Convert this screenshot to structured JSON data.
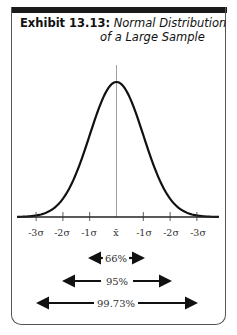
{
  "exhibit": {
    "label": "Exhibit 13.13:",
    "title_line1": "Normal Distribution",
    "title_line2": "of a Large Sample"
  },
  "chart_data": {
    "type": "line",
    "title": "Normal Distribution of a Large Sample",
    "xlabel": "",
    "ylabel": "",
    "x_tick_labels": [
      "-3σ",
      "-2σ",
      "-1σ",
      "x̄",
      "-1σ",
      "-2σ",
      "-3σ"
    ],
    "curve": "bell-shaped normal curve centered at mean x̄",
    "center_line": true,
    "grid": false,
    "intervals": [
      {
        "label": "66%",
        "span_sigma": 1
      },
      {
        "label": "95%",
        "span_sigma": 2
      },
      {
        "label": "99.73%",
        "span_sigma": 3
      }
    ]
  },
  "colors": {
    "curve": "#111111",
    "axis": "#222222",
    "header_bar": "#1a1a1a"
  }
}
